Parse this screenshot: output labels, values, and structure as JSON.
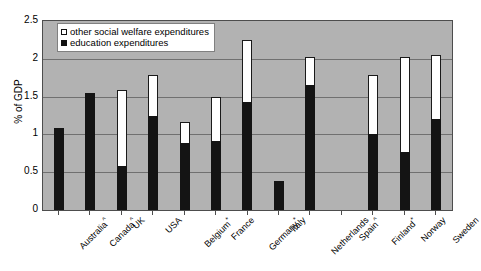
{
  "chart_data": {
    "type": "bar",
    "subtype": "stacked-vertical",
    "title": "",
    "xlabel": "",
    "ylabel": "% of GDP",
    "ylim": [
      0,
      2.5
    ],
    "y_ticks": [
      "0",
      "0.5",
      "1",
      "1.5",
      "2",
      "2.5"
    ],
    "y_tick_values": [
      0,
      0.5,
      1,
      1.5,
      2,
      2.5
    ],
    "grid": true,
    "grid_axis": "y",
    "legend_position": "top-left-inside",
    "categories": [
      "Australia^",
      "Canada^",
      "UK",
      "USA",
      "Belgium*",
      "France",
      "Germany*",
      "Italy",
      "Netherlands",
      "Spain^",
      "Finland*",
      "Norway",
      "Sweden"
    ],
    "category_labels": [
      {
        "name": "Australia",
        "mark": "^"
      },
      {
        "name": "Canada",
        "mark": "^"
      },
      {
        "name": "UK",
        "mark": ""
      },
      {
        "name": "USA",
        "mark": ""
      },
      {
        "name": "Belgium",
        "mark": "*"
      },
      {
        "name": "France",
        "mark": ""
      },
      {
        "name": "Germany",
        "mark": "*"
      },
      {
        "name": "Italy",
        "mark": ""
      },
      {
        "name": "Netherlands",
        "mark": ""
      },
      {
        "name": "Spain",
        "mark": "^"
      },
      {
        "name": "Finland",
        "mark": "*"
      },
      {
        "name": "Norway",
        "mark": ""
      },
      {
        "name": "Sweden",
        "mark": ""
      }
    ],
    "series": [
      {
        "name": "education expenditures",
        "color": "#141414",
        "values": [
          1.09,
          1.55,
          0.58,
          1.25,
          0.88,
          0.91,
          1.43,
          0.38,
          1.65,
          0,
          1.01,
          0.77,
          1.21
        ]
      },
      {
        "name": "other social welfare expenditures",
        "color": "#ffffff",
        "values": [
          0,
          0,
          1.01,
          0.53,
          0.29,
          0.58,
          0.82,
          0,
          0.37,
          0,
          0.77,
          1.26,
          0.84
        ]
      }
    ],
    "totals": [
      1.09,
      1.55,
      1.59,
      1.78,
      1.17,
      1.49,
      2.25,
      0.38,
      2.02,
      0,
      1.78,
      2.03,
      2.05
    ],
    "plot_background": "#b2b2b2",
    "page_background": "#ffffff"
  },
  "legend": {
    "items": [
      {
        "label": "other social welfare expenditures",
        "swatch": "open"
      },
      {
        "label": "education expenditures",
        "swatch": "filled"
      }
    ]
  }
}
